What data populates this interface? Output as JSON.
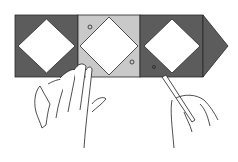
{
  "illustration": {
    "subject": "patchwork strip being pressed by hand while tweezers lift a piece",
    "colors": {
      "dark_fabric": "#5c5c5c",
      "light_fabric": "#c9c9c9",
      "center_square": "#ffffff",
      "outline": "#2a2a2a",
      "background": "#ffffff"
    },
    "blocks": [
      {
        "position": 1,
        "corner_color": "dark"
      },
      {
        "position": 2,
        "corner_color": "light"
      },
      {
        "position": 3,
        "corner_color": "dark"
      },
      {
        "position": 4,
        "shape": "arrow-point",
        "corner_color": "dark"
      }
    ]
  }
}
